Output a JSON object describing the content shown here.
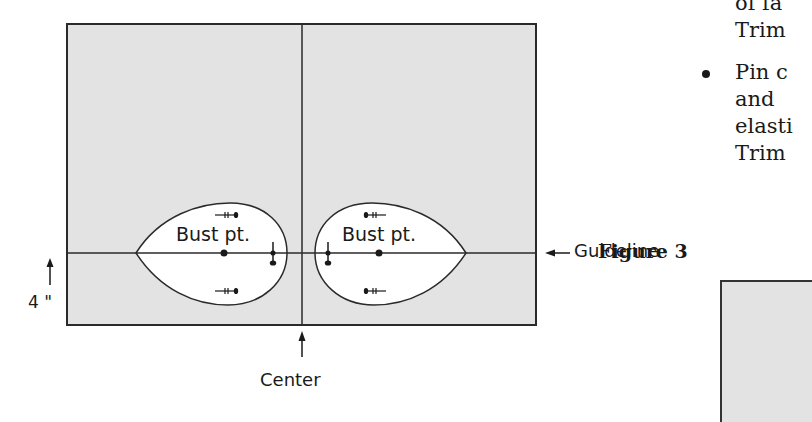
{
  "figure": {
    "labels": {
      "bust_left": "Bust pt.",
      "bust_right": "Bust pt.",
      "guideline": "Guideline",
      "center": "Center",
      "measure": "4 \""
    },
    "colors": {
      "fabric_fill": "#e3e3e3",
      "outline": "#2a2a2a",
      "cutout_fill": "#ffffff"
    }
  },
  "side_text": {
    "lines": [
      "of fa",
      "Trim",
      "Pin c",
      "and",
      "elasti",
      "Trim"
    ],
    "bullet": "•"
  },
  "next_figure": {
    "title": "Figure 3"
  }
}
